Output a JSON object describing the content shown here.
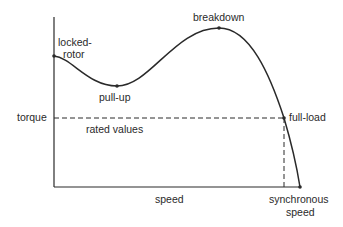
{
  "diagram": {
    "colors": {
      "line": "#2a2a2a",
      "background": "#ffffff"
    },
    "axes": {
      "y_label": "torque",
      "x_label": "speed"
    },
    "points": {
      "locked_rotor": {
        "label_line1": "locked-",
        "label_line2": "rotor"
      },
      "pull_up": {
        "label": "pull-up"
      },
      "breakdown": {
        "label": "breakdown"
      },
      "full_load": {
        "label": "full-load"
      },
      "synchronous": {
        "label_line1": "synchronous",
        "label_line2": "speed"
      }
    },
    "rated_values_label": "rated values"
  }
}
